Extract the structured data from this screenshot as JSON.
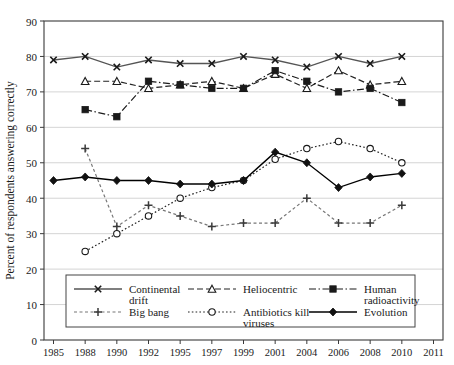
{
  "chart_data": {
    "type": "line",
    "title": "",
    "xlabel": "",
    "ylabel": "Percent of respondents answering correctly",
    "ylim": [
      0,
      90
    ],
    "ytick_step": 10,
    "yticks": [
      0,
      10,
      20,
      30,
      40,
      50,
      60,
      70,
      80,
      90
    ],
    "grid": true,
    "grid_axis": "y",
    "legend_position": "inside-bottom",
    "categories": [
      "1985",
      "1988",
      "1990",
      "1992",
      "1995",
      "1997",
      "1999",
      "2001",
      "2004",
      "2006",
      "2008",
      "2010",
      "2011"
    ],
    "xticks": [
      "1985",
      "1988",
      "1990",
      "1992",
      "1995",
      "1997",
      "1999",
      "2001",
      "2004",
      "2006",
      "2008",
      "2010",
      "2011"
    ],
    "series": [
      {
        "name": "Continental drift",
        "marker": "x",
        "linestyle": "solid",
        "color": "#555555",
        "x": [
          "1985",
          "1988",
          "1990",
          "1992",
          "1995",
          "1997",
          "1999",
          "2001",
          "2004",
          "2006",
          "2008",
          "2010"
        ],
        "values": [
          79,
          80,
          77,
          79,
          78,
          78,
          80,
          79,
          77,
          80,
          78,
          80
        ]
      },
      {
        "name": "Heliocentric",
        "marker": "triangle-open",
        "linestyle": "dashed",
        "color": "#222222",
        "x": [
          "1988",
          "1990",
          "1992",
          "1995",
          "1997",
          "1999",
          "2001",
          "2004",
          "2006",
          "2008",
          "2010"
        ],
        "values": [
          73,
          73,
          71,
          72,
          73,
          71,
          75,
          71,
          76,
          72,
          73
        ]
      },
      {
        "name": "Human radioactivity",
        "marker": "square-filled",
        "linestyle": "dashdot",
        "color": "#1a1a1a",
        "x": [
          "1988",
          "1990",
          "1992",
          "1995",
          "1997",
          "1999",
          "2001",
          "2004",
          "2006",
          "2008",
          "2010"
        ],
        "values": [
          65,
          63,
          73,
          72,
          71,
          71,
          76,
          73,
          70,
          71,
          67
        ]
      },
      {
        "name": "Big bang",
        "marker": "plus",
        "linestyle": "dashed-fine",
        "color": "#777777",
        "x": [
          "1988",
          "1990",
          "1992",
          "1995",
          "1997",
          "1999",
          "2001",
          "2004",
          "2006",
          "2008",
          "2010"
        ],
        "values": [
          54,
          32,
          38,
          35,
          32,
          33,
          33,
          40,
          33,
          33,
          38
        ]
      },
      {
        "name": "Antibiotics kill viruses",
        "marker": "circle-open",
        "linestyle": "dotted",
        "color": "#222222",
        "x": [
          "1988",
          "1990",
          "1992",
          "1995",
          "1997",
          "1999",
          "2001",
          "2004",
          "2006",
          "2008",
          "2010"
        ],
        "values": [
          25,
          30,
          35,
          40,
          43,
          45,
          51,
          54,
          56,
          54,
          50
        ]
      },
      {
        "name": "Evolution",
        "marker": "diamond-filled",
        "linestyle": "solid",
        "color": "#000000",
        "x": [
          "1985",
          "1988",
          "1990",
          "1992",
          "1995",
          "1997",
          "1999",
          "2001",
          "2004",
          "2006",
          "2008",
          "2010"
        ],
        "values": [
          45,
          46,
          45,
          45,
          44,
          44,
          45,
          53,
          50,
          43,
          46,
          47
        ]
      }
    ]
  },
  "legend": {
    "entries": [
      {
        "label_line1": "Continental",
        "label_line2": "drift",
        "key": "continental-drift"
      },
      {
        "label_line1": "Heliocentric",
        "label_line2": "",
        "key": "heliocentric"
      },
      {
        "label_line1": "Human",
        "label_line2": "radioactivity",
        "key": "human-radioactivity"
      },
      {
        "label_line1": "Big bang",
        "label_line2": "",
        "key": "big-bang"
      },
      {
        "label_line1": "Antibiotics kill",
        "label_line2": "viruses",
        "key": "antibiotics-kill-viruses"
      },
      {
        "label_line1": "Evolution",
        "label_line2": "",
        "key": "evolution"
      }
    ]
  }
}
